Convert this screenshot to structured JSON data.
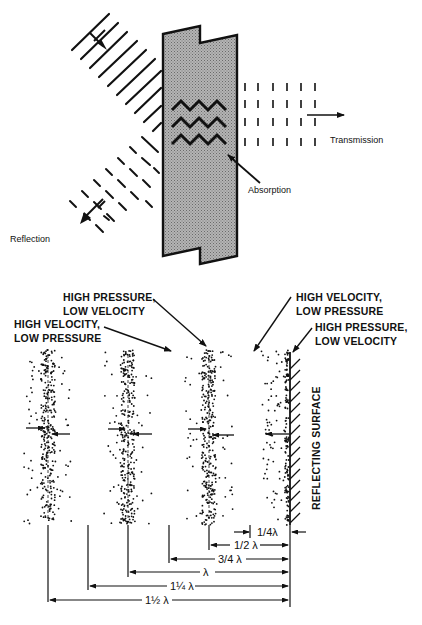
{
  "top_diagram": {
    "labels": {
      "transmission": "Transmission",
      "absorption": "Absorption",
      "reflection": "Reflection"
    }
  },
  "bottom_diagram": {
    "labels": {
      "hp_lv_1_line1": "HIGH PRESSURE,",
      "hp_lv_1_line2": "LOW VELOCITY",
      "hv_lp_1_line1": "HIGH VELOCITY,",
      "hv_lp_1_line2": "LOW PRESSURE",
      "hv_lp_2_line1": "HIGH VELOCITY,",
      "hv_lp_2_line2": "LOW PRESSURE",
      "hp_lv_2_line1": "HIGH PRESSURE,",
      "hp_lv_2_line2": "LOW VELOCITY",
      "reflecting_surface": "REFLECTING SURFACE"
    },
    "dimensions": [
      {
        "label": "1/4λ"
      },
      {
        "label": "1/2 λ"
      },
      {
        "label": "3/4 λ"
      },
      {
        "label": "λ"
      },
      {
        "label": "1¼ λ"
      },
      {
        "label": "1½ λ"
      }
    ]
  },
  "colors": {
    "ink": "#111111",
    "panel_fill": "#a8a8a8",
    "background": "#ffffff"
  }
}
